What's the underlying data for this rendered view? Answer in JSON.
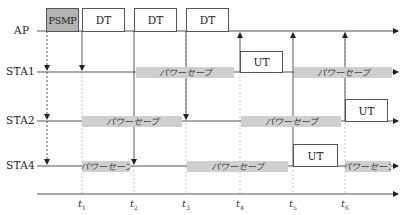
{
  "diagram": {
    "rows": [
      {
        "id": "ap",
        "label": "AP"
      },
      {
        "id": "sta1",
        "label": "STA1"
      },
      {
        "id": "sta2",
        "label": "STA2"
      },
      {
        "id": "sta4",
        "label": "STA4"
      }
    ],
    "frames": {
      "psmp": "PSMP",
      "dt1": "DT",
      "dt2": "DT",
      "dt3": "DT",
      "ut_sta1": "UT",
      "ut_sta2": "UT",
      "ut_sta4": "UT"
    },
    "power_save_label": "パワーセーブ",
    "power_save": {
      "sta1_a": "パワーセーブ",
      "sta1_b": "パワーセーブ",
      "sta2_a": "パワーセーブ",
      "sta2_b": "パワーセーブ",
      "sta4_a": "パワーセーブ",
      "sta4_b": "パワーセーブ",
      "sta4_c": "パワーセーブ"
    },
    "time_marks": [
      {
        "t": "t",
        "sub": "1"
      },
      {
        "t": "t",
        "sub": "2"
      },
      {
        "t": "t",
        "sub": "3"
      },
      {
        "t": "t",
        "sub": "4"
      },
      {
        "t": "t",
        "sub": "5"
      },
      {
        "t": "t",
        "sub": "6"
      }
    ],
    "colors": {
      "line": "#555555",
      "psmp_fill": "#b3b3b3",
      "power_save_fill": "#cfcfcf",
      "guide": "#bbbbbb"
    }
  }
}
